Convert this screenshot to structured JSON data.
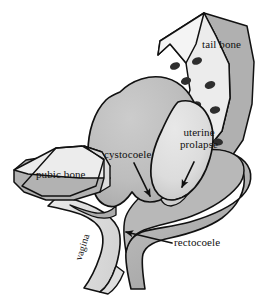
{
  "figure": {
    "type": "medical-illustration",
    "background_color": "#ffffff",
    "outline_color": "#111111"
  },
  "labels": {
    "tail_bone": "tail bone",
    "pubic_bone": "pubic bone",
    "cystocoele": "cystocoele",
    "uterine_prolapse": "uterine\nprolapse",
    "uterine_prolapse_line1": "uterine",
    "uterine_prolapse_line2": "prolapse",
    "rectocoele": "rectocoele",
    "vagina": "vagina"
  },
  "structures": [
    {
      "name": "tail-bone",
      "label": "tail bone",
      "description": "sacrum and coccyx, curved wedge at upper right with sacral foramina",
      "fill_light": "#ececec",
      "fill_shadow": "#b0b0b0",
      "foramina_count": 8,
      "foramina_color": "#2e2e2e"
    },
    {
      "name": "pubic-bone",
      "label": "pubic bone",
      "description": "wedge shaped bone at left",
      "fill_light": "#e6e6e6",
      "fill_shadow": "#b2b2b2"
    },
    {
      "name": "cystocoele",
      "label": "cystocoele",
      "description": "prolapsed bladder, large round sac, center",
      "fill": "#bdbdbd"
    },
    {
      "name": "uterine-prolapse",
      "label": "uterine prolapse",
      "description": "prolapsed uterus, pear shaped sac, right of bladder",
      "fill": "#dcdcdc"
    },
    {
      "name": "rectocoele",
      "label": "rectocoele",
      "description": "prolapsed rectum, dark band sweeping right and down",
      "fill": "#b5b5b5"
    },
    {
      "name": "vagina",
      "label": "vagina",
      "description": "vaginal canal descending at lower left",
      "fill": "#e3e3e3"
    }
  ],
  "arrows": [
    {
      "name": "cystocoele-arrow",
      "from_label": "cystocoele",
      "points_to": "cystocoele"
    },
    {
      "name": "uterine-prolapse-arrow",
      "from_label": "uterine prolapse",
      "points_to": "uterine-prolapse"
    },
    {
      "name": "rectocoele-arrow",
      "from_label": "rectocoele",
      "points_to": "rectocoele"
    }
  ],
  "colors": {
    "outline": "#111111",
    "bladder_gray": "#bdbdbd",
    "uterus_gray": "#dcdcdc",
    "rectum_gray": "#b5b5b5",
    "bone_light": "#ececec",
    "bone_shadow": "#b0b0b0",
    "vagina_gray": "#e3e3e3",
    "text": "#101010",
    "background": "#ffffff"
  }
}
